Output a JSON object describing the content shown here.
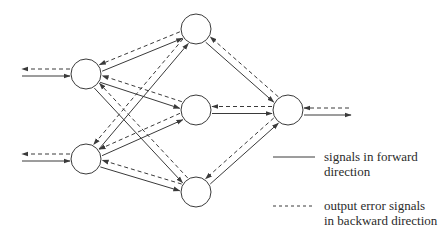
{
  "diagram": {
    "title": "",
    "stroke_color": "#3a3a3a",
    "node_radius": 15,
    "nodes": [
      {
        "id": "input-1",
        "layer": "input",
        "cx": 86,
        "cy": 74
      },
      {
        "id": "input-2",
        "layer": "input",
        "cx": 86,
        "cy": 159
      },
      {
        "id": "hidden-1",
        "layer": "hidden",
        "cx": 196,
        "cy": 29
      },
      {
        "id": "hidden-2",
        "layer": "hidden",
        "cx": 196,
        "cy": 110
      },
      {
        "id": "hidden-3",
        "layer": "hidden",
        "cx": 196,
        "cy": 192
      },
      {
        "id": "output-1",
        "layer": "output",
        "cx": 288,
        "cy": 110
      }
    ],
    "edges": [
      {
        "from": "input-1",
        "to": "hidden-1"
      },
      {
        "from": "input-1",
        "to": "hidden-2"
      },
      {
        "from": "input-1",
        "to": "hidden-3"
      },
      {
        "from": "input-2",
        "to": "hidden-1"
      },
      {
        "from": "input-2",
        "to": "hidden-2"
      },
      {
        "from": "input-2",
        "to": "hidden-3"
      },
      {
        "from": "hidden-1",
        "to": "output-1"
      },
      {
        "from": "hidden-2",
        "to": "output-1"
      },
      {
        "from": "hidden-3",
        "to": "output-1"
      }
    ],
    "external_inputs": [
      {
        "node": "input-1",
        "x_start": 22
      },
      {
        "node": "input-2",
        "x_start": 22
      }
    ],
    "external_outputs": [
      {
        "node": "output-1",
        "x_end": 351
      }
    ]
  },
  "legend": {
    "forward": {
      "style": "solid",
      "line1": "signals in forward",
      "line2": "direction"
    },
    "backward": {
      "style": "dashed",
      "line1": "output error signals",
      "line2": "in backward direction"
    }
  }
}
